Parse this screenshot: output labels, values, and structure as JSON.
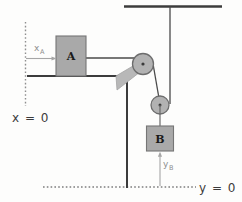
{
  "figure": {
    "blocks": [
      {
        "id": "A",
        "label": "A"
      },
      {
        "id": "B",
        "label": "B"
      }
    ],
    "coordinate_labels": [
      {
        "id": "xA",
        "base": "x",
        "sub": "A"
      },
      {
        "id": "yB",
        "base": "y",
        "sub": "B"
      }
    ],
    "datum_labels": [
      {
        "id": "x-origin",
        "text": "x = 0"
      },
      {
        "id": "y-origin",
        "text": "y = 0"
      }
    ],
    "colors": {
      "block_fill": "#a9a9a9",
      "block_stroke": "#6f6f6f",
      "pulley_fill": "#b2b2b2",
      "pulley_stroke": "#6d6d6d",
      "bracket_fill": "#b8b8b8",
      "rope": "#4a4a4a",
      "structure": "#3c3c3c",
      "datum_dotted": "#8c8c8c",
      "dimension_arrow": "#a2a2a2",
      "background": "#fdfdfc"
    },
    "geometry": {
      "ceiling_y": 6,
      "ceiling_x_start": 124,
      "ceiling_x_end": 222,
      "hanger_x": 170,
      "fixed_pulley": {
        "cx": 143,
        "cy": 64,
        "r": 10.5
      },
      "movable_pulley": {
        "cx": 160,
        "cy": 105,
        "r": 9
      },
      "block_a": {
        "x": 56,
        "y": 36,
        "w": 30,
        "h": 40
      },
      "block_b": {
        "x": 146,
        "y": 126,
        "w": 27,
        "h": 25
      },
      "ground_a_y": 76,
      "rope_a_y": 58,
      "post_x": 127,
      "floor_y": 187,
      "floor_x_start": 43,
      "floor_x_end": 195,
      "wall_x": 25,
      "wall_y_start": 22,
      "wall_y_end": 105
    }
  }
}
